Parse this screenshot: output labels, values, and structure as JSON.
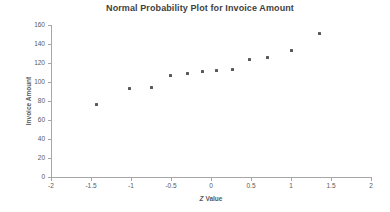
{
  "chart_data": {
    "type": "scatter",
    "title": "Normal Probability Plot for Invoice Amount",
    "xlabel": "Z Value",
    "xlabel_parts": {
      "italic": "Z",
      "rest": " Value"
    },
    "ylabel": "Invoice Amount",
    "xlim": [
      -2,
      2
    ],
    "ylim": [
      0,
      160
    ],
    "x_tick_labels": [
      "-2",
      "-1.5",
      "-1",
      "-0.5",
      "0",
      "0.5",
      "1",
      "1.5",
      "2"
    ],
    "y_tick_labels": [
      "0",
      "20",
      "40",
      "60",
      "80",
      "100",
      "120",
      "140",
      "160"
    ],
    "grid": false,
    "legend": "none",
    "marker": {
      "shape": "square",
      "size_px": 3,
      "color": "#595959"
    },
    "axis_color": "#a6a6a6",
    "tick_text_color": "#595959",
    "title_color": "#3f3f3f",
    "points": [
      {
        "z": -1.43,
        "amount": 76
      },
      {
        "z": -1.02,
        "amount": 93
      },
      {
        "z": -0.75,
        "amount": 94
      },
      {
        "z": -0.51,
        "amount": 107
      },
      {
        "z": -0.3,
        "amount": 109
      },
      {
        "z": -0.11,
        "amount": 111
      },
      {
        "z": 0.07,
        "amount": 112
      },
      {
        "z": 0.27,
        "amount": 113
      },
      {
        "z": 0.48,
        "amount": 124
      },
      {
        "z": 0.71,
        "amount": 126
      },
      {
        "z": 1.0,
        "amount": 133
      },
      {
        "z": 1.36,
        "amount": 151
      }
    ]
  }
}
